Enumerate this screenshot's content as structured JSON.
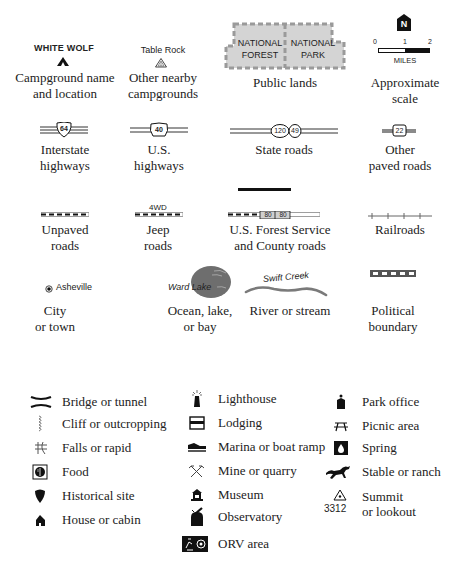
{
  "legend": {
    "row1": {
      "campground": {
        "map_label": "WHITE WOLF",
        "caption_line1": "Campground name",
        "caption_line2": "and location"
      },
      "other_campgrounds": {
        "map_label": "Table Rock",
        "caption_line1": "Other nearby",
        "caption_line2": "campgrounds"
      },
      "public_lands": {
        "forest_line1": "NATIONAL",
        "forest_line2": "FOREST",
        "park_line1": "NATIONAL",
        "park_line2": "PARK",
        "caption": "Public lands"
      },
      "scale": {
        "north_label": "N",
        "tick0": "0",
        "tick1": "1",
        "tick2": "2",
        "unit": "MILES",
        "caption_line1": "Approximate",
        "caption_line2": "scale"
      }
    },
    "row2": {
      "interstate": {
        "shield": "64",
        "caption_line1": "Interstate",
        "caption_line2": "highways"
      },
      "us_highway": {
        "shield": "40",
        "caption_line1": "U.S.",
        "caption_line2": "highways"
      },
      "state_roads": {
        "shield1": "120",
        "shield2": "49",
        "caption": "State roads"
      },
      "other_paved": {
        "shield": "22",
        "caption_line1": "Other",
        "caption_line2": "paved roads"
      }
    },
    "row3": {
      "unpaved": {
        "caption_line1": "Unpaved",
        "caption_line2": "roads"
      },
      "jeep": {
        "map_label": "4WD",
        "caption_line1": "Jeep",
        "caption_line2": "roads"
      },
      "forest_service": {
        "shield1": "80",
        "shield2": "80",
        "caption_line1": "U.S. Forest Service",
        "caption_line2": "and County roads"
      },
      "railroads": {
        "caption": "Railroads"
      }
    },
    "row4": {
      "city": {
        "map_label": "Asheville",
        "caption_line1": "City",
        "caption_line2": "or town"
      },
      "lake": {
        "map_label": "Ward Lake",
        "caption_line1": "Ocean, lake,",
        "caption_line2": "or bay"
      },
      "river": {
        "map_label": "Swift Creek",
        "caption": "River or stream"
      },
      "political": {
        "caption_line1": "Political",
        "caption_line2": "boundary"
      }
    },
    "symbols": {
      "col1": [
        {
          "icon": "bridge-icon",
          "label": "Bridge or tunnel"
        },
        {
          "icon": "cliff-icon",
          "label": "Cliff or outcropping"
        },
        {
          "icon": "falls-icon",
          "label": "Falls or rapid"
        },
        {
          "icon": "food-icon",
          "label": "Food"
        },
        {
          "icon": "historical-site-icon",
          "label": "Historical site"
        },
        {
          "icon": "house-icon",
          "label": "House or cabin"
        }
      ],
      "col2": [
        {
          "icon": "lighthouse-icon",
          "label": "Lighthouse"
        },
        {
          "icon": "lodging-icon",
          "label": "Lodging"
        },
        {
          "icon": "marina-icon",
          "label": "Marina or boat ramp"
        },
        {
          "icon": "mine-icon",
          "label": "Mine or quarry"
        },
        {
          "icon": "museum-icon",
          "label": "Museum"
        },
        {
          "icon": "observatory-icon",
          "label": "Observatory"
        },
        {
          "icon": "orv-icon",
          "label": "ORV area"
        }
      ],
      "col3": [
        {
          "icon": "park-office-icon",
          "label": "Park office"
        },
        {
          "icon": "picnic-icon",
          "label": "Picnic area"
        },
        {
          "icon": "spring-icon",
          "label": "Spring"
        },
        {
          "icon": "stable-icon",
          "label": "Stable or ranch"
        },
        {
          "icon": "summit-icon",
          "label": "Summit",
          "label2": "or lookout",
          "elevation": "3312"
        }
      ]
    }
  },
  "colors": {
    "ink": "#111111",
    "gray_land": "#d4d4d4",
    "gray_border": "#9a9a9a",
    "lake": "#6e6e6e",
    "river": "#7a7a7a"
  }
}
